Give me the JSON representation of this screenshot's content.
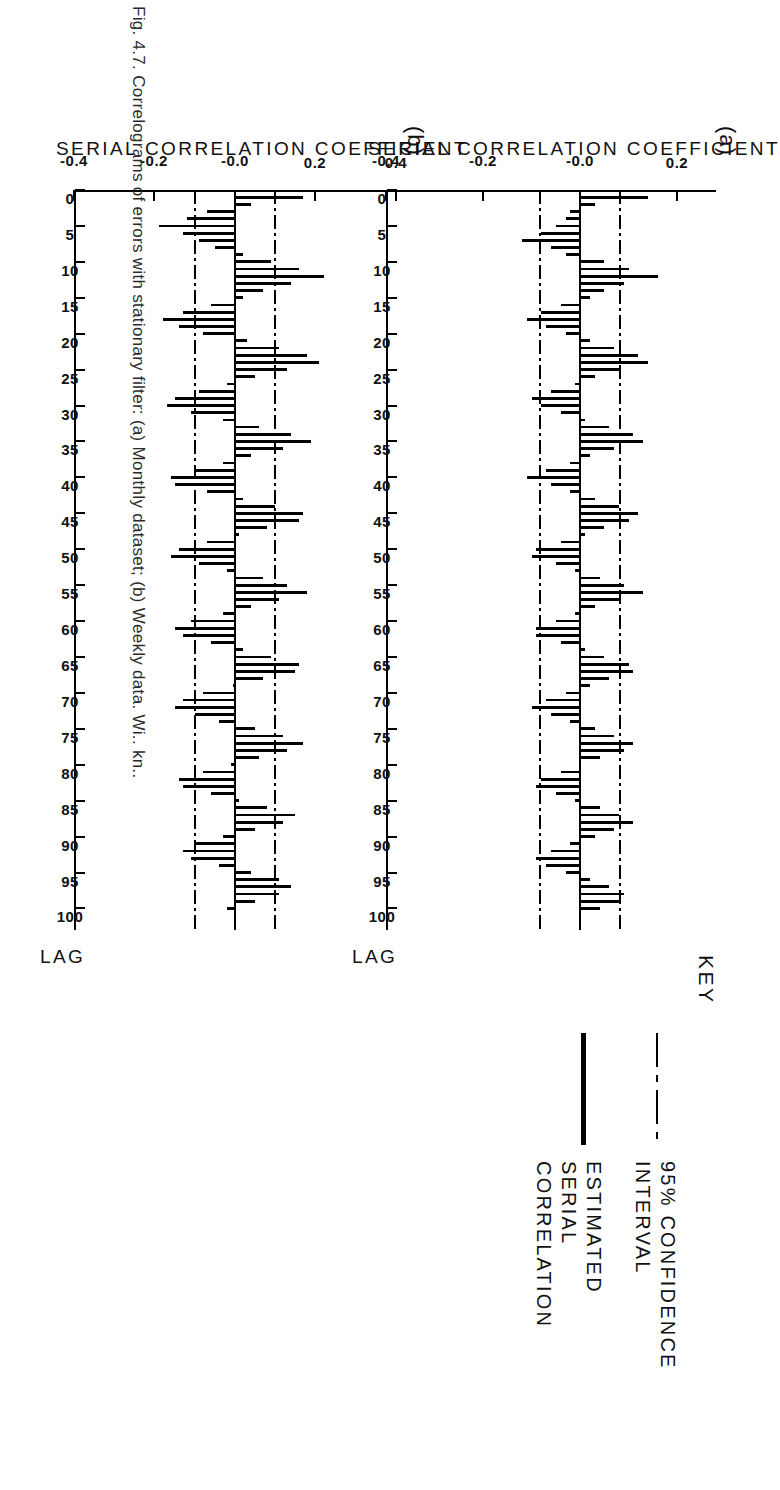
{
  "figure": {
    "caption": "Fig. 4.7.  Correlograms of errors with stationary filter: (a) Monthly dataset; (b) Weekly data. Wi.. kn..",
    "caption_visible": "partially cut off at page edge"
  },
  "key": {
    "title": "KEY",
    "entries": [
      {
        "label_line1": "95% CONFIDENCE",
        "label_line2": "INTERVAL",
        "style": "dash-dot",
        "icon": "dash-dot-line-icon"
      },
      {
        "label_line1": "ESTIMATED SERIAL",
        "label_line2": "CORRELATION",
        "style": "solid-thick",
        "icon": "solid-line-icon"
      }
    ]
  },
  "charts": [
    {
      "panel": "(a)",
      "xlabel": "LAG",
      "ylabel": "SERIAL CORRELATION COEFFICIENT"
    },
    {
      "panel": "(b)",
      "xlabel": "LAG",
      "ylabel": "SERIAL CORRELATION COEFFICIENT"
    }
  ],
  "chart_data": [
    {
      "type": "bar",
      "panel": "(a)",
      "title": "",
      "xlabel": "LAG",
      "ylabel": "SERIAL CORRELATION COEFFICIENT",
      "xlim": [
        0,
        103
      ],
      "ylim": [
        -0.4,
        0.28
      ],
      "xticks": [
        0,
        5,
        10,
        15,
        20,
        25,
        30,
        35,
        40,
        45,
        50,
        55,
        60,
        65,
        70,
        75,
        80,
        85,
        90,
        95,
        100
      ],
      "xticklabels": [
        "0",
        "5",
        "10",
        "15",
        "20",
        "25",
        "30",
        "35",
        "40",
        "45",
        "50",
        "55",
        "60",
        "65",
        "70",
        "75",
        "80",
        "85",
        "90",
        "95",
        "100"
      ],
      "yticks": [
        0.2,
        -0.0,
        -0.2,
        -0.4
      ],
      "yticklabels": [
        "0.2",
        "-0.0",
        "-0.2",
        "-0.4"
      ],
      "grid": false,
      "legend_position": "outside-right",
      "confidence_interval": {
        "label": "95% CONFIDENCE INTERVAL",
        "upper": 0.082,
        "lower": -0.082,
        "style": "dash-dot"
      },
      "zero_line": 0.0,
      "x": [
        1,
        2,
        3,
        4,
        5,
        6,
        7,
        8,
        9,
        10,
        11,
        12,
        13,
        14,
        15,
        16,
        17,
        18,
        19,
        20,
        21,
        22,
        23,
        24,
        25,
        26,
        27,
        28,
        29,
        30,
        31,
        32,
        33,
        34,
        35,
        36,
        37,
        38,
        39,
        40,
        41,
        42,
        43,
        44,
        45,
        46,
        47,
        48,
        49,
        50,
        51,
        52,
        53,
        54,
        55,
        56,
        57,
        58,
        59,
        60,
        61,
        62,
        63,
        64,
        65,
        66,
        67,
        68,
        69,
        70,
        71,
        72,
        73,
        74,
        75,
        76,
        77,
        78,
        79,
        80,
        81,
        82,
        83,
        84,
        85,
        86,
        87,
        88,
        89,
        90,
        91,
        92,
        93,
        94,
        95,
        96,
        97,
        98,
        99,
        100
      ],
      "values": [
        0.14,
        0.03,
        -0.02,
        -0.03,
        -0.05,
        -0.08,
        -0.12,
        -0.06,
        -0.03,
        0.05,
        0.1,
        0.16,
        0.09,
        0.05,
        0.02,
        -0.04,
        -0.08,
        -0.11,
        -0.07,
        -0.03,
        0.02,
        0.07,
        0.12,
        0.14,
        0.08,
        0.03,
        -0.01,
        -0.06,
        -0.1,
        -0.08,
        -0.04,
        0.01,
        0.06,
        0.11,
        0.13,
        0.07,
        0.02,
        -0.02,
        -0.07,
        -0.11,
        -0.06,
        -0.02,
        0.03,
        0.08,
        0.12,
        0.1,
        0.05,
        0.01,
        -0.04,
        -0.09,
        -0.1,
        -0.05,
        -0.01,
        0.04,
        0.09,
        0.13,
        0.08,
        0.03,
        -0.01,
        -0.05,
        -0.09,
        -0.09,
        -0.04,
        0.01,
        0.05,
        0.1,
        0.11,
        0.06,
        0.02,
        -0.03,
        -0.07,
        -0.1,
        -0.06,
        -0.02,
        0.03,
        0.07,
        0.11,
        0.09,
        0.04,
        0.0,
        -0.04,
        -0.08,
        -0.09,
        -0.05,
        -0.01,
        0.04,
        0.08,
        0.11,
        0.07,
        0.03,
        -0.02,
        -0.06,
        -0.09,
        -0.07,
        -0.03,
        0.02,
        0.06,
        0.09,
        0.08,
        0.04,
        -0.01,
        -0.05
      ]
    },
    {
      "type": "bar",
      "panel": "(b)",
      "title": "",
      "xlabel": "LAG",
      "ylabel": "SERIAL CORRELATION COEFFICIENT",
      "xlim": [
        0,
        103
      ],
      "ylim": [
        -0.4,
        0.42
      ],
      "xticks": [
        0,
        5,
        10,
        15,
        20,
        25,
        30,
        35,
        40,
        45,
        50,
        55,
        60,
        65,
        70,
        75,
        80,
        85,
        90,
        95,
        100
      ],
      "xticklabels": [
        "0",
        "5",
        "10",
        "15",
        "20",
        "25",
        "30",
        "35",
        "40",
        "45",
        "50",
        "55",
        "60",
        "65",
        "70",
        "75",
        "80",
        "85",
        "90",
        "95",
        "100"
      ],
      "yticks": [
        0.4,
        0.2,
        -0.0,
        -0.2,
        -0.4
      ],
      "yticklabels": [
        "0.4",
        "0.2",
        "-0.0",
        "-0.2",
        "-0.4"
      ],
      "grid": false,
      "legend_position": "outside-right",
      "confidence_interval": {
        "label": "95% CONFIDENCE INTERVAL",
        "upper": 0.1,
        "lower": -0.1,
        "style": "dash-dot"
      },
      "zero_line": 0.0,
      "x": [
        1,
        2,
        3,
        4,
        5,
        6,
        7,
        8,
        9,
        10,
        11,
        12,
        13,
        14,
        15,
        16,
        17,
        18,
        19,
        20,
        21,
        22,
        23,
        24,
        25,
        26,
        27,
        28,
        29,
        30,
        31,
        32,
        33,
        34,
        35,
        36,
        37,
        38,
        39,
        40,
        41,
        42,
        43,
        44,
        45,
        46,
        47,
        48,
        49,
        50,
        51,
        52,
        53,
        54,
        55,
        56,
        57,
        58,
        59,
        60,
        61,
        62,
        63,
        64,
        65,
        66,
        67,
        68,
        69,
        70,
        71,
        72,
        73,
        74,
        75,
        76,
        77,
        78,
        79,
        80,
        81,
        82,
        83,
        84,
        85,
        86,
        87,
        88,
        89,
        90,
        91,
        92,
        93,
        94,
        95,
        96,
        97,
        98,
        99,
        100
      ],
      "values": [
        0.17,
        0.04,
        -0.07,
        -0.12,
        -0.19,
        -0.13,
        -0.09,
        -0.05,
        0.02,
        0.09,
        0.16,
        0.22,
        0.14,
        0.07,
        0.02,
        -0.06,
        -0.13,
        -0.18,
        -0.14,
        -0.08,
        0.03,
        0.11,
        0.18,
        0.21,
        0.13,
        0.05,
        -0.02,
        -0.09,
        -0.15,
        -0.17,
        -0.11,
        -0.03,
        0.06,
        0.14,
        0.19,
        0.12,
        0.04,
        -0.03,
        -0.1,
        -0.16,
        -0.15,
        -0.07,
        0.02,
        0.1,
        0.17,
        0.16,
        0.08,
        0.01,
        -0.07,
        -0.14,
        -0.16,
        -0.09,
        -0.02,
        0.07,
        0.13,
        0.18,
        0.11,
        0.04,
        -0.03,
        -0.11,
        -0.15,
        -0.13,
        -0.06,
        0.02,
        0.09,
        0.16,
        0.15,
        0.07,
        0.0,
        -0.08,
        -0.13,
        -0.15,
        -0.1,
        -0.04,
        0.05,
        0.12,
        0.17,
        0.13,
        0.06,
        -0.01,
        -0.08,
        -0.14,
        -0.13,
        -0.06,
        0.01,
        0.08,
        0.15,
        0.12,
        0.05,
        -0.03,
        -0.1,
        -0.13,
        -0.11,
        -0.04,
        0.04,
        0.11,
        0.14,
        0.11,
        0.05,
        -0.02,
        -0.09
      ]
    }
  ]
}
